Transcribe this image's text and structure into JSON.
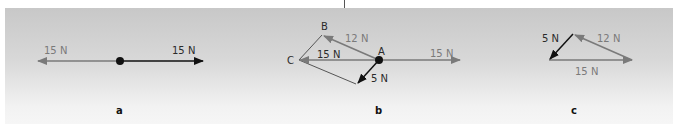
{
  "colors": {
    "gray_vector": "#7a7a7a",
    "black_vector": "#111111",
    "panel_top": "#c8c8c8",
    "panel_bottom": "#f6f6f6"
  },
  "panel_a": {
    "caption": "a",
    "left_force_label": "15 N",
    "right_force_label": "15 N"
  },
  "panel_b": {
    "caption": "b",
    "point_a": "A",
    "point_b": "B",
    "point_c": "C",
    "force_12_label": "12 N",
    "force_15_left_label": "15 N",
    "force_15_right_label": "15 N",
    "force_5_label": "5 N"
  },
  "panel_c": {
    "caption": "c",
    "force_5_label": "5 N",
    "force_12_label": "12 N",
    "force_15_label": "15 N"
  }
}
